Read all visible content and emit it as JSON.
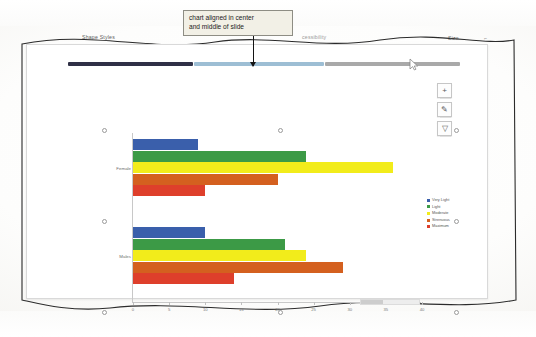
{
  "ribbon": {
    "shape_styles": "Shape Styles",
    "accessibility": "cessibility",
    "size": "Size",
    "dialog_launcher": "⌐"
  },
  "callout": {
    "line1": "chart aligned in center",
    "line2": "and middle of slide"
  },
  "guides": {
    "dark_color": "#2f3046",
    "blue_color": "#9dbed4",
    "gray_color": "#a9a9a9"
  },
  "chart_buttons": [
    {
      "name": "chart-elements",
      "glyph": "+"
    },
    {
      "name": "chart-styles",
      "glyph": "✎"
    },
    {
      "name": "chart-filters",
      "glyph": "▽"
    }
  ],
  "chart_data": {
    "type": "bar",
    "orientation": "horizontal",
    "title": "",
    "xlabel": "",
    "ylabel": "",
    "categories": [
      "Female",
      "Males"
    ],
    "xlim": [
      0,
      40
    ],
    "xticks": [
      0,
      5,
      10,
      15,
      20,
      25,
      30,
      35,
      40
    ],
    "xtick_labels": [
      "0",
      "5",
      "10",
      "15",
      "20",
      "25",
      "30",
      "35",
      "40"
    ],
    "grid": false,
    "legend_position": "right",
    "series": [
      {
        "name": "Very Light",
        "color": "#3a5fab",
        "values": [
          9,
          10
        ]
      },
      {
        "name": "Light",
        "color": "#3c9a46",
        "values": [
          24,
          21
        ]
      },
      {
        "name": "Moderate",
        "color": "#f2ec1b",
        "values": [
          36,
          24
        ]
      },
      {
        "name": "Strenuous",
        "color": "#d4601f",
        "values": [
          20,
          29
        ]
      },
      {
        "name": "Maximum",
        "color": "#de3f2b",
        "values": [
          10,
          14
        ]
      }
    ]
  },
  "status": {
    "zoom_bar": ""
  }
}
